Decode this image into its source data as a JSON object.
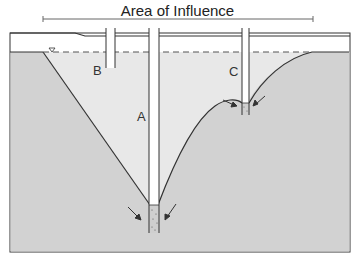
{
  "title": "Area of Influence",
  "wells": [
    {
      "label": "A",
      "description": "pumping well with deep cone of depression"
    },
    {
      "label": "B",
      "description": "shallow well, dry (above lowered water table)"
    },
    {
      "label": "C",
      "description": "shallow pumping well with small cone of depression"
    }
  ],
  "symbols": {
    "water_table_marker": "▽",
    "flow_arrows": "arrows pointing toward well screens"
  },
  "colors": {
    "saturated_zone": "#d2d2d2",
    "unsaturated_zone": "#ffffff",
    "cone_of_depression": "#e6e6e6",
    "lines": "#333333"
  }
}
